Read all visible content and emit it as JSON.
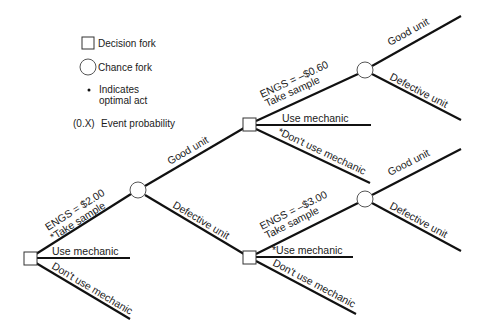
{
  "legend": {
    "decision_fork": "Decision fork",
    "chance_fork": "Chance fork",
    "optimal_marker": "•",
    "optimal_line1": "Indicates",
    "optimal_line2": "optimal act",
    "probability_symbol": "(0.X)",
    "probability_label": "Event probability"
  },
  "root": {
    "engs": "ENGS = $2.00",
    "take_sample": "*Take sample",
    "use_mechanic": "Use mechanic",
    "dont_use_mechanic": "Don't use mechanic"
  },
  "chance1": {
    "good_unit": "Good unit",
    "defective_unit": "Defective unit"
  },
  "upper_decision": {
    "engs": "ENGS = –$0.60",
    "take_sample": "Take sample",
    "use_mechanic": "Use mechanic",
    "dont_use_mechanic": "*Don't use mechanic"
  },
  "lower_decision": {
    "engs": "ENGS = –$3.00",
    "take_sample": "Take sample",
    "use_mechanic": "*Use mechanic",
    "dont_use_mechanic": "Don't use mechanic"
  },
  "upper_chance": {
    "good_unit": "Good unit",
    "defective_unit": "Defective unit"
  },
  "lower_chance": {
    "good_unit": "Good unit",
    "defective_unit": "Defective unit"
  },
  "colors": {
    "line": "#111111",
    "background": "#ffffff"
  }
}
